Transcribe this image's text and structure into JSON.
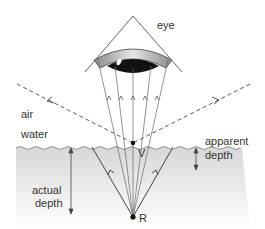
{
  "diagram": {
    "labels": {
      "eye": "eye",
      "air": "air",
      "water": "water",
      "apparent_depth_line1": "apparent",
      "apparent_depth_line2": "depth",
      "actual_depth_line1": "actual",
      "actual_depth_line2": "depth",
      "virtual_image_point": "V",
      "real_object_point": "R"
    },
    "colors": {
      "line": "#555555",
      "water_top": "#d9d9d9",
      "water_bottom": "#ffffff",
      "pupil": "#111111",
      "iris_band": "#9a9a9a"
    }
  }
}
